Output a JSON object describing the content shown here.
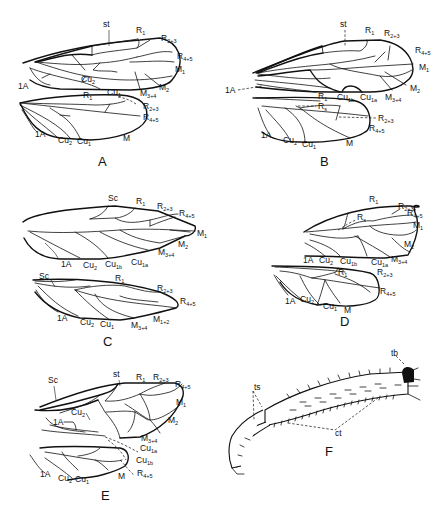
{
  "figure": {
    "panels": [
      {
        "id": "A",
        "label": "A",
        "forewing_labels": [
          "st",
          "R1",
          "R2+3",
          "R4+5",
          "M1",
          "M2",
          "M3+4",
          "Cu1",
          "Cu2",
          "1A"
        ],
        "hindwing_labels": [
          "R1",
          "R2+3",
          "R4+5",
          "M",
          "Cu1",
          "Cu2",
          "1A"
        ]
      },
      {
        "id": "B",
        "label": "B",
        "forewing_labels": [
          "st",
          "R1",
          "R2+3",
          "R4+5",
          "M1",
          "M2",
          "M3+4",
          "Cu1a",
          "Cu1b",
          "1A"
        ],
        "hindwing_labels": [
          "R1",
          "Rs",
          "R2+3",
          "R4+5",
          "M",
          "Cu1",
          "Cu2",
          "1A"
        ]
      },
      {
        "id": "C",
        "label": "C",
        "forewing_labels": [
          "Sc",
          "R1",
          "R2+3",
          "R4+5",
          "M1",
          "M2",
          "M3+4",
          "Cu1a",
          "Cu1b",
          "Cu2",
          "1A"
        ],
        "hindwing_labels": [
          "Sc",
          "R1",
          "R2+3",
          "R4+5",
          "M1+2",
          "M3+4",
          "Cu1",
          "Cu2",
          "1A"
        ]
      },
      {
        "id": "D",
        "label": "D",
        "forewing_labels": [
          "R1",
          "Rs",
          "R2+3",
          "R4+5",
          "M1",
          "M2",
          "M3+4",
          "Cu1a",
          "Cu1b",
          "Cu2",
          "1A"
        ],
        "hindwing_labels": [
          "R1",
          "R2+3",
          "R4+5",
          "M",
          "Cu1",
          "Cu2",
          "1A"
        ]
      },
      {
        "id": "E",
        "label": "E",
        "forewing_labels": [
          "Sc",
          "st",
          "R1",
          "R2+3",
          "R4+5",
          "M1",
          "M2",
          "M3+4",
          "Cu1a",
          "Cu1b",
          "Cu2",
          "1A"
        ],
        "hindwing_labels": [
          "M",
          "R4+5",
          "Cu1",
          "Cu2",
          "1A"
        ]
      },
      {
        "id": "F",
        "label": "F",
        "leg_labels": [
          "tb",
          "ts",
          "ct"
        ]
      }
    ]
  },
  "text": {
    "st": "st",
    "sc": "Sc",
    "one_a": "1A",
    "m": "M",
    "r": "R",
    "cu": "Cu",
    "s1": "1",
    "s23": "2+3",
    "s45": "4+5",
    "s34": "3+4",
    "s12": "1+2",
    "s2": "2",
    "s1a": "1a",
    "s1b": "1b",
    "ss": "s",
    "m_letter": "M",
    "tb": "tb",
    "ts": "ts",
    "ct": "ct",
    "plate_a": "A",
    "plate_b": "B",
    "plate_c": "C",
    "plate_d": "D",
    "plate_e": "E",
    "plate_f": "F"
  }
}
